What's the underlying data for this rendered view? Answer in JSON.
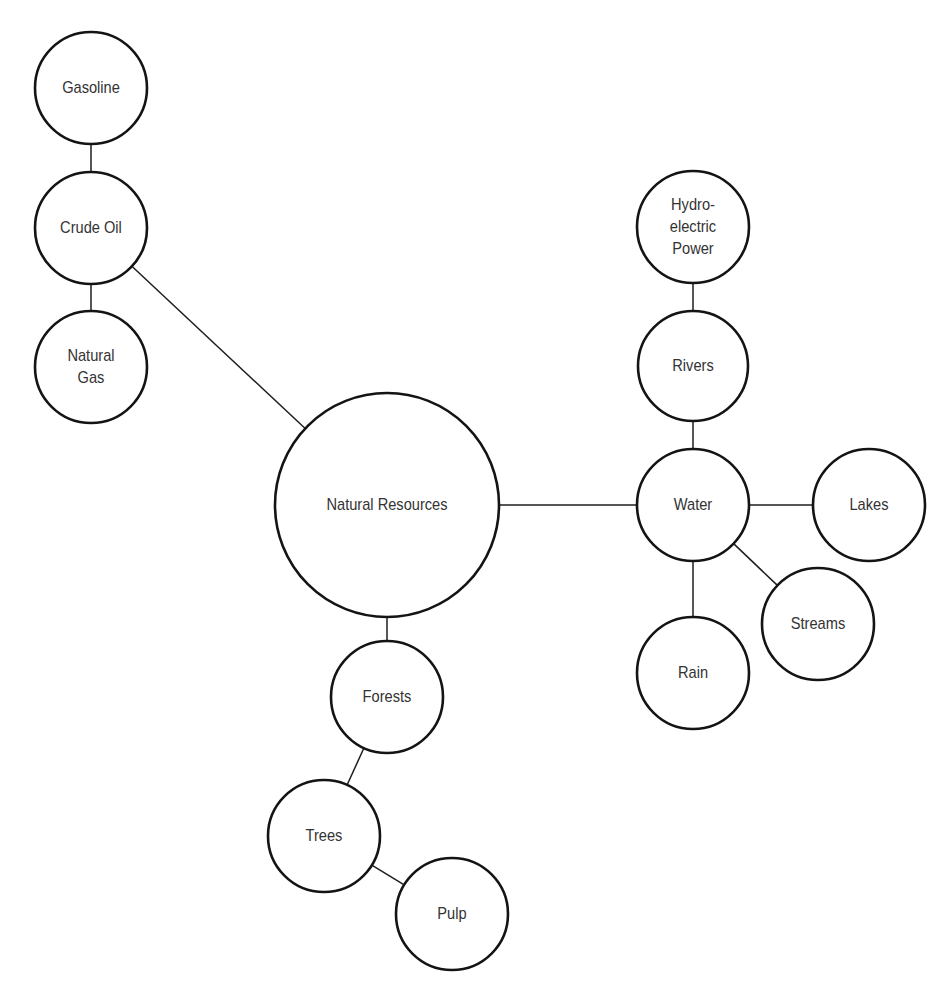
{
  "diagram": {
    "type": "concept-map",
    "colors": {
      "background": "#ffffff",
      "stroke": "#141414",
      "text": "#333333"
    },
    "nodes": [
      {
        "id": "natural_resources",
        "label": "Natural Resources",
        "cx": 387,
        "cy": 505,
        "r": 112
      },
      {
        "id": "crude_oil",
        "label": "Crude Oil",
        "cx": 91,
        "cy": 228,
        "r": 56
      },
      {
        "id": "gasoline",
        "label": "Gasoline",
        "cx": 91,
        "cy": 88,
        "r": 56
      },
      {
        "id": "natural_gas",
        "label": "Natural\nGas",
        "cx": 91,
        "cy": 367,
        "r": 56
      },
      {
        "id": "water",
        "label": "Water",
        "cx": 693,
        "cy": 505,
        "r": 56
      },
      {
        "id": "rivers",
        "label": "Rivers",
        "cx": 693,
        "cy": 366,
        "r": 55
      },
      {
        "id": "hydroelectric_power",
        "label": "Hydro-\nelectric\nPower",
        "cx": 693,
        "cy": 227,
        "r": 56
      },
      {
        "id": "lakes",
        "label": "Lakes",
        "cx": 869,
        "cy": 505,
        "r": 56
      },
      {
        "id": "streams",
        "label": "Streams",
        "cx": 818,
        "cy": 624,
        "r": 56
      },
      {
        "id": "rain",
        "label": "Rain",
        "cx": 693,
        "cy": 673,
        "r": 56
      },
      {
        "id": "forests",
        "label": "Forests",
        "cx": 387,
        "cy": 697,
        "r": 56
      },
      {
        "id": "trees",
        "label": "Trees",
        "cx": 324,
        "cy": 836,
        "r": 56
      },
      {
        "id": "pulp",
        "label": "Pulp",
        "cx": 452,
        "cy": 914,
        "r": 56
      }
    ],
    "edges": [
      {
        "from": "gasoline",
        "to": "crude_oil"
      },
      {
        "from": "crude_oil",
        "to": "natural_gas"
      },
      {
        "from": "crude_oil",
        "to": "natural_resources"
      },
      {
        "from": "natural_resources",
        "to": "water"
      },
      {
        "from": "natural_resources",
        "to": "forests"
      },
      {
        "from": "hydroelectric_power",
        "to": "rivers"
      },
      {
        "from": "rivers",
        "to": "water"
      },
      {
        "from": "water",
        "to": "lakes"
      },
      {
        "from": "water",
        "to": "streams"
      },
      {
        "from": "water",
        "to": "rain"
      },
      {
        "from": "forests",
        "to": "trees"
      },
      {
        "from": "trees",
        "to": "pulp"
      }
    ]
  }
}
